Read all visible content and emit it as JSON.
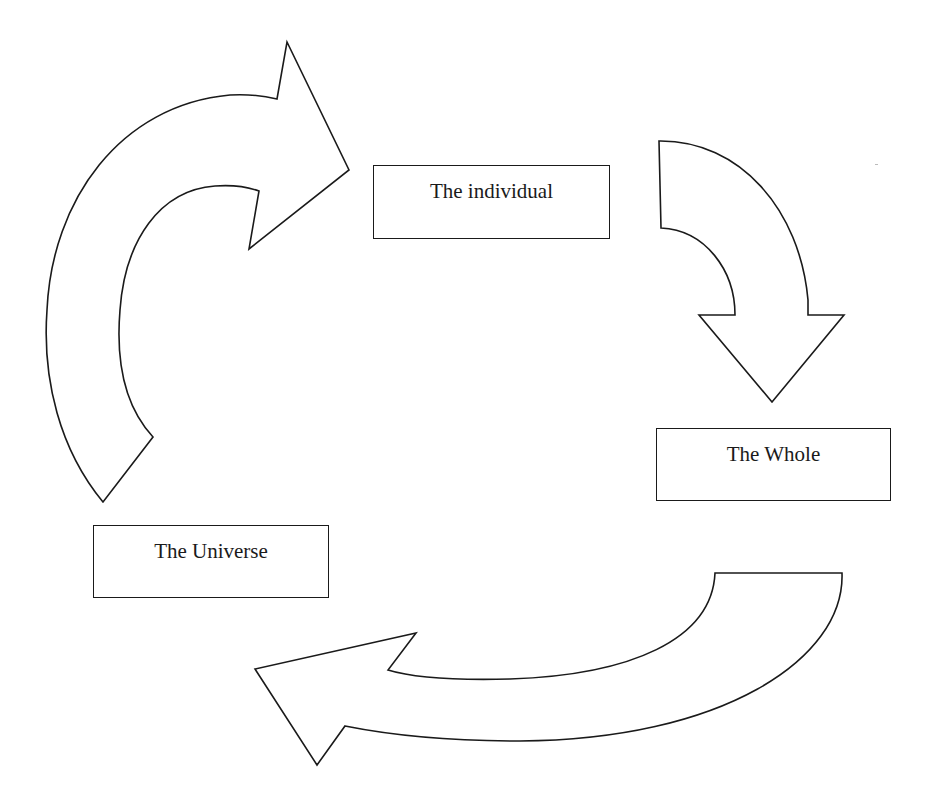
{
  "diagram": {
    "type": "cycle",
    "nodes": [
      {
        "id": "individual",
        "label": "The individual"
      },
      {
        "id": "whole",
        "label": "The Whole"
      },
      {
        "id": "universe",
        "label": "The Universe"
      }
    ],
    "edges": [
      {
        "from": "universe",
        "to": "individual",
        "style": "curved-block-arrow"
      },
      {
        "from": "individual",
        "to": "whole",
        "style": "curved-block-arrow"
      },
      {
        "from": "whole",
        "to": "universe",
        "style": "curved-block-arrow"
      }
    ],
    "colors": {
      "stroke": "#1a1a1a",
      "fill": "#ffffff",
      "background": "#ffffff"
    }
  }
}
